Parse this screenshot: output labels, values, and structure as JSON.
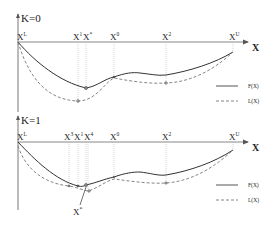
{
  "figure": {
    "width": 276,
    "height": 231,
    "colors": {
      "axis": "#555555",
      "f_curve": "#333333",
      "l_curve": "#777777",
      "guide": "#bbbbbb",
      "point": "#666666"
    }
  },
  "panels": [
    {
      "id": "k0",
      "title": "K=0",
      "axis_label": "X",
      "ticks": [
        {
          "base": "X",
          "sup": "L"
        },
        {
          "base": "X",
          "sup": "1"
        },
        {
          "base": "X",
          "sup": "*"
        },
        {
          "base": "X",
          "sup": "0"
        },
        {
          "base": "X",
          "sup": "2"
        },
        {
          "base": "X",
          "sup": "U"
        }
      ],
      "legend": [
        {
          "label": "F(X)",
          "style": "solid"
        },
        {
          "label": "L(X)",
          "style": "dashed"
        }
      ]
    },
    {
      "id": "k1",
      "title": "K=1",
      "axis_label": "X",
      "ticks": [
        {
          "base": "X",
          "sup": "L"
        },
        {
          "base": "X",
          "sup": "3"
        },
        {
          "base": "X",
          "sup": "1"
        },
        {
          "base": "X",
          "sup": "4"
        },
        {
          "base": "X",
          "sup": "0"
        },
        {
          "base": "X",
          "sup": "2"
        },
        {
          "base": "X",
          "sup": "U"
        }
      ],
      "callout": {
        "base": "X",
        "sup": "*"
      },
      "legend": [
        {
          "label": "F(X)",
          "style": "solid"
        },
        {
          "label": "L(X)",
          "style": "dashed"
        }
      ]
    }
  ]
}
